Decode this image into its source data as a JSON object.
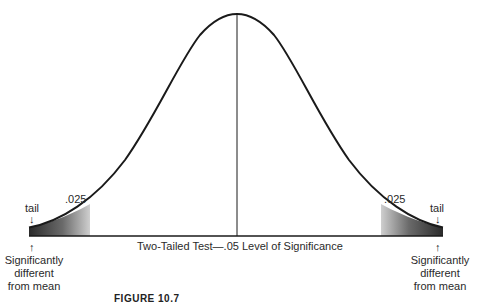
{
  "diagram": {
    "type": "normal-distribution-two-tailed-test",
    "axis_label": "Two-Tailed Test—.05 Level of Significance",
    "left_tail": {
      "area_label": ".025",
      "tail_label": "tail",
      "note_lines": [
        "Significantly",
        "different",
        "from mean"
      ]
    },
    "right_tail": {
      "area_label": ".025",
      "tail_label": "tail",
      "note_lines": [
        "Significantly",
        "different",
        "from mean"
      ]
    },
    "arrow_down": "↓",
    "arrow_up": "↑",
    "caption": "FIGURE 10.7"
  },
  "colors": {
    "curve": "#1a1a1a",
    "shade_dark": "#2e2e2e",
    "shade_light": "#c8c8c8",
    "background": "#ffffff"
  }
}
